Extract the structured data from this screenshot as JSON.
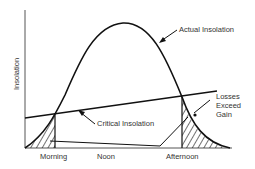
{
  "diagram": {
    "y_axis_label": "Insolation",
    "x_axis_labels": [
      "Morning",
      "Noon",
      "Afternoon"
    ],
    "curves": {
      "actual": "Actual Insolation",
      "critical": "Critical Insolation"
    },
    "annotation": {
      "line1": "Losses",
      "line2": "Exceed",
      "line3": "Gain"
    },
    "colors": {
      "stroke": "#111111",
      "text": "#333333",
      "axis": "#555555"
    }
  }
}
